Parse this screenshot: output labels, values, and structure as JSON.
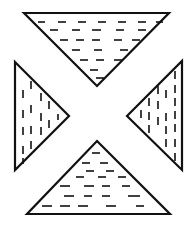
{
  "figure": {
    "stroke_color": "#111111",
    "background": "#ffffff",
    "triangles": [
      {
        "name": "top",
        "points": [
          [
            24,
            13
          ],
          [
            169,
            13
          ],
          [
            97,
            86
          ]
        ],
        "hatch": "horizontal",
        "dashes": [
          [
            38,
            22,
            45,
            22
          ],
          [
            58,
            22,
            66,
            22
          ],
          [
            78,
            22,
            86,
            22
          ],
          [
            98,
            22,
            106,
            22
          ],
          [
            118,
            22,
            126,
            22
          ],
          [
            138,
            22,
            146,
            22
          ],
          [
            156,
            22,
            163,
            22
          ],
          [
            50,
            30,
            58,
            30
          ],
          [
            72,
            30,
            80,
            30
          ],
          [
            92,
            30,
            101,
            30
          ],
          [
            116,
            30,
            124,
            30
          ],
          [
            138,
            30,
            146,
            30
          ],
          [
            60,
            40,
            68,
            40
          ],
          [
            76,
            40,
            84,
            40
          ],
          [
            92,
            40,
            100,
            40
          ],
          [
            114,
            40,
            122,
            40
          ],
          [
            132,
            40,
            140,
            40
          ],
          [
            72,
            50,
            80,
            50
          ],
          [
            94,
            50,
            102,
            50
          ],
          [
            120,
            50,
            128,
            50
          ],
          [
            80,
            60,
            88,
            60
          ],
          [
            96,
            60,
            104,
            60
          ],
          [
            114,
            60,
            122,
            60
          ],
          [
            90,
            70,
            98,
            70
          ],
          [
            96,
            78,
            104,
            78
          ]
        ]
      },
      {
        "name": "bottom",
        "points": [
          [
            97,
            141
          ],
          [
            170,
            214
          ],
          [
            27,
            214
          ]
        ],
        "hatch": "horizontal",
        "dashes": [
          [
            92,
            153,
            100,
            153
          ],
          [
            82,
            163,
            90,
            163
          ],
          [
            100,
            163,
            108,
            163
          ],
          [
            86,
            171,
            94,
            171
          ],
          [
            106,
            171,
            114,
            171
          ],
          [
            76,
            177,
            84,
            177
          ],
          [
            98,
            177,
            106,
            177
          ],
          [
            118,
            177,
            126,
            177
          ],
          [
            60,
            186,
            70,
            186
          ],
          [
            84,
            186,
            94,
            186
          ],
          [
            102,
            186,
            110,
            186
          ],
          [
            122,
            186,
            130,
            186
          ],
          [
            64,
            196,
            74,
            196
          ],
          [
            84,
            196,
            92,
            196
          ],
          [
            102,
            196,
            110,
            196
          ],
          [
            128,
            196,
            140,
            196
          ],
          [
            42,
            206,
            52,
            206
          ],
          [
            60,
            206,
            70,
            206
          ],
          [
            78,
            206,
            88,
            206
          ],
          [
            106,
            206,
            116,
            206
          ],
          [
            136,
            206,
            144,
            206
          ]
        ]
      },
      {
        "name": "left",
        "points": [
          [
            15,
            62
          ],
          [
            69,
            116
          ],
          [
            15,
            170
          ]
        ],
        "hatch": "vertical",
        "dashes": [
          [
            31,
            81,
            31,
            89
          ],
          [
            23,
            90,
            23,
            98
          ],
          [
            41,
            93,
            41,
            101
          ],
          [
            49,
            101,
            49,
            109
          ],
          [
            23,
            110,
            23,
            118
          ],
          [
            31,
            105,
            31,
            113
          ],
          [
            41,
            113,
            41,
            121
          ],
          [
            49,
            120,
            49,
            128
          ],
          [
            58,
            114,
            58,
            120
          ],
          [
            23,
            127,
            23,
            135
          ],
          [
            31,
            126,
            31,
            134
          ],
          [
            41,
            127,
            41,
            135
          ],
          [
            23,
            146,
            23,
            154
          ],
          [
            31,
            141,
            31,
            149
          ],
          [
            23,
            158,
            23,
            164
          ]
        ]
      },
      {
        "name": "right",
        "points": [
          [
            182,
            61
          ],
          [
            182,
            170
          ],
          [
            127,
            116
          ]
        ],
        "hatch": "vertical",
        "dashes": [
          [
            175,
            71,
            175,
            79
          ],
          [
            175,
            85,
            175,
            93
          ],
          [
            158,
            86,
            158,
            94
          ],
          [
            166,
            90,
            166,
            98
          ],
          [
            149,
            98,
            149,
            106
          ],
          [
            158,
            101,
            158,
            109
          ],
          [
            175,
            98,
            175,
            106
          ],
          [
            141,
            110,
            141,
            118
          ],
          [
            149,
            112,
            149,
            120
          ],
          [
            166,
            113,
            166,
            121
          ],
          [
            175,
            111,
            175,
            119
          ],
          [
            149,
            125,
            149,
            133
          ],
          [
            158,
            117,
            158,
            125
          ],
          [
            166,
            126,
            166,
            134
          ],
          [
            175,
            124,
            175,
            132
          ],
          [
            166,
            139,
            166,
            147
          ],
          [
            175,
            139,
            175,
            147
          ],
          [
            175,
            153,
            175,
            161
          ]
        ]
      }
    ]
  }
}
